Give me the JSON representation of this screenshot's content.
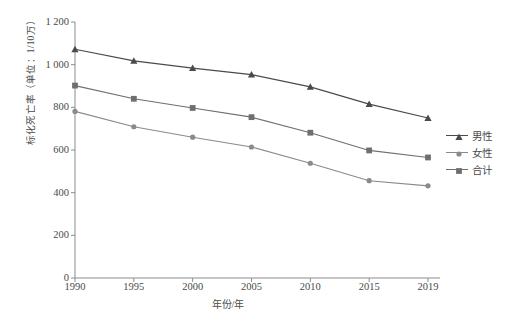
{
  "chart_data": {
    "type": "line",
    "title": "",
    "xlabel": "年份/年",
    "ylabel": "标化死亡率（单位：1/10万）",
    "categories": [
      "1990",
      "1995",
      "2000",
      "2005",
      "2010",
      "2015",
      "2019"
    ],
    "x": [
      1990,
      1995,
      2000,
      2005,
      2010,
      2015,
      2019
    ],
    "ylim": [
      0,
      1200
    ],
    "yticks": [
      "0",
      "200",
      "400",
      "600",
      "800",
      "1 000",
      "1 200"
    ],
    "ytick_values": [
      0,
      200,
      400,
      600,
      800,
      1000,
      1200
    ],
    "grid": false,
    "legend_position": "right",
    "series": [
      {
        "name": "男性",
        "marker": "triangle",
        "color": "#4a4a4a",
        "values": [
          1072,
          1018,
          984,
          953,
          896,
          815,
          750
        ]
      },
      {
        "name": "女性",
        "marker": "circle",
        "color": "#8a8a8a",
        "values": [
          781,
          709,
          660,
          614,
          538,
          456,
          432
        ]
      },
      {
        "name": "合计",
        "marker": "square",
        "color": "#6f6f6f",
        "values": [
          902,
          840,
          797,
          754,
          681,
          598,
          565
        ]
      }
    ]
  },
  "legend": {
    "items": [
      {
        "label": "男性",
        "marker": "triangle-marker",
        "color": "#4a4a4a"
      },
      {
        "label": "女性",
        "marker": "circle-marker",
        "color": "#8a8a8a"
      },
      {
        "label": "合计",
        "marker": "square-marker",
        "color": "#6f6f6f"
      }
    ]
  },
  "axes": {
    "y_title": "标化死亡率（单位：1/10万）",
    "x_title": "年份/年",
    "axis_color": "#8c8c8c"
  }
}
